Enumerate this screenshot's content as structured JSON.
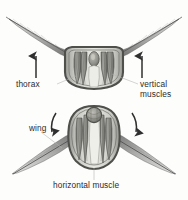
{
  "diagram": {
    "type": "anatomical-cross-section",
    "background_color": "#fdfdfc",
    "ink_color": "#3a3a3a",
    "leader_line_color": "#b2b2ae",
    "panels": [
      {
        "id": "upstroke",
        "position": "top",
        "description": "Thorax cross-section with wings raised; vertical muscles contracted",
        "wing_state": "raised",
        "arrows": [
          {
            "name": "left-upstroke-arrow",
            "direction": "up",
            "style": "straight"
          },
          {
            "name": "right-upstroke-arrow",
            "direction": "up",
            "style": "straight"
          }
        ]
      },
      {
        "id": "downstroke",
        "position": "bottom",
        "description": "Thorax cross-section with wings lowered; horizontal muscle contracted",
        "wing_state": "lowered",
        "arrows": [
          {
            "name": "left-downstroke-arrow",
            "direction": "down-left",
            "style": "curved"
          },
          {
            "name": "right-downstroke-arrow",
            "direction": "down-right",
            "style": "curved"
          }
        ]
      }
    ],
    "labels": {
      "thorax": "thorax",
      "vertical_muscles_line1": "vertical",
      "vertical_muscles_line2": "muscles",
      "wing": "wing",
      "horizontal_muscle": "horizontal muscle"
    }
  }
}
